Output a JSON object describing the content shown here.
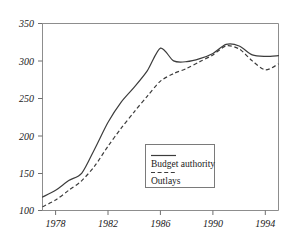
{
  "chart_data": {
    "type": "line",
    "title": "",
    "subtitle": "",
    "xlabel": "",
    "ylabel": "",
    "xlim": [
      1977,
      1995
    ],
    "ylim": [
      100,
      350
    ],
    "grid": false,
    "legend_position": "center-right",
    "y_ticks": [
      "350",
      "300",
      "250",
      "200",
      "150",
      "100"
    ],
    "y_tick_values": [
      350,
      300,
      250,
      200,
      150,
      100
    ],
    "x_ticks": [
      "1978",
      "1982",
      "1986",
      "1990",
      "1994"
    ],
    "x_tick_values": [
      1978,
      1982,
      1986,
      1990,
      1994
    ],
    "x": [
      1977,
      1978,
      1979,
      1980,
      1981,
      1982,
      1983,
      1984,
      1985,
      1986,
      1987,
      1988,
      1989,
      1990,
      1991,
      1992,
      1993,
      1994,
      1995
    ],
    "series": [
      {
        "name": "Budget authority",
        "style": "solid",
        "values": [
          118,
          127,
          140,
          150,
          183,
          218,
          245,
          265,
          287,
          317,
          300,
          299,
          303,
          310,
          322,
          320,
          308,
          306,
          307
        ]
      },
      {
        "name": "Outlays",
        "style": "dashed",
        "values": [
          105,
          114,
          127,
          140,
          160,
          186,
          210,
          232,
          253,
          273,
          283,
          290,
          299,
          308,
          320,
          316,
          300,
          288,
          296
        ]
      }
    ],
    "legend": [
      {
        "label": "Budget authority",
        "style": "solid"
      },
      {
        "label": "Outlays",
        "style": "dashed"
      }
    ],
    "colors": {
      "series_line": "#3c3c3c",
      "frame": "#8d8d8d",
      "text": "#1a1a1a",
      "background": "#ffffff"
    }
  }
}
